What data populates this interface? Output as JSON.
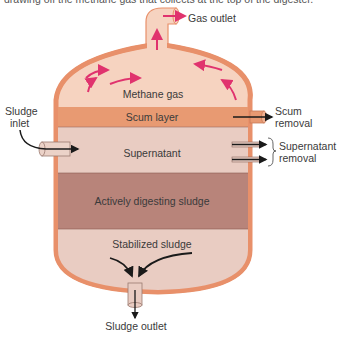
{
  "caption": "drawing off the methane gas that collects at the top of the digester.",
  "labels": {
    "gas_outlet": "Gas outlet",
    "methane_gas": "Methane gas",
    "scum_layer": "Scum layer",
    "scum_removal_1": "Scum",
    "scum_removal_2": "removal",
    "sludge_inlet_1": "Sludge",
    "sludge_inlet_2": "inlet",
    "supernatant": "Supernatant",
    "supernatant_removal_1": "Supernatant",
    "supernatant_removal_2": "removal",
    "active_sludge": "Actively digesting sludge",
    "stabilized_sludge": "Stabilized sludge",
    "sludge_outlet": "Sludge outlet"
  },
  "colors": {
    "vessel_outline": "#E8906A",
    "gas_zone": "#F6D3C0",
    "scum": "#E89A72",
    "supernatant": "#E9CCC2",
    "active_sludge": "#B8847A",
    "stabilized": "#E9CCC2",
    "gas_arrows": "#E0336E",
    "flow_arrows": "#1a1a1a"
  }
}
